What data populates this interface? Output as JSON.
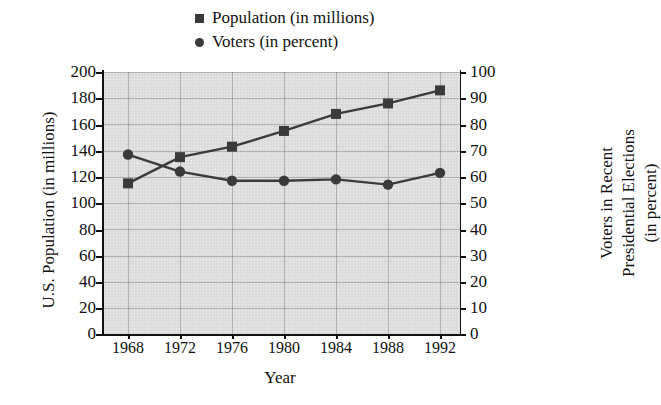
{
  "chart_data": {
    "type": "line",
    "title": "",
    "xlabel": "Year",
    "ylabel": "U.S. Population (in millions)",
    "ylabel_right_lines": [
      "Voters in Recent",
      "Presidential Elections",
      "(in percent)"
    ],
    "x": [
      1968,
      1972,
      1976,
      1980,
      1984,
      1988,
      1992
    ],
    "xtick_labels": [
      "1968",
      "1972",
      "1976",
      "1980",
      "1984",
      "1988",
      "1992"
    ],
    "ylim": [
      0,
      200
    ],
    "ytick_labels": [
      "0",
      "20",
      "40",
      "60",
      "80",
      "100",
      "120",
      "140",
      "160",
      "180",
      "200"
    ],
    "ylim_right": [
      0,
      100
    ],
    "ytick_labels_right": [
      "0",
      "10",
      "20",
      "30",
      "40",
      "50",
      "60",
      "70",
      "80",
      "90",
      "100"
    ],
    "grid": true,
    "legend_position": "top-center",
    "series": [
      {
        "name": "Population (in millions)",
        "marker": "square",
        "axis": "left",
        "color": "#3a3a3a",
        "values": [
          115,
          135,
          143,
          155,
          168,
          176,
          186
        ]
      },
      {
        "name": "Voters (in percent)",
        "marker": "circle",
        "axis": "right",
        "color": "#3a3a3a",
        "values": [
          68.5,
          62,
          58.5,
          58.5,
          59,
          57,
          61.5
        ]
      }
    ]
  },
  "legend": {
    "items": [
      {
        "label": "Population (in millions)",
        "marker": "square"
      },
      {
        "label": "Voters (in percent)",
        "marker": "circle"
      }
    ]
  },
  "axes": {
    "x_title": "Year",
    "y_left_title": "U.S. Population (in millions)",
    "y_right_title_line1": "Voters in Recent",
    "y_right_title_line2": "Presidential Elections",
    "y_right_title_line3": "(in percent)"
  },
  "colors": {
    "plot_background": "#dcdcdc",
    "series": "#3a3a3a",
    "axis": "#111111"
  }
}
